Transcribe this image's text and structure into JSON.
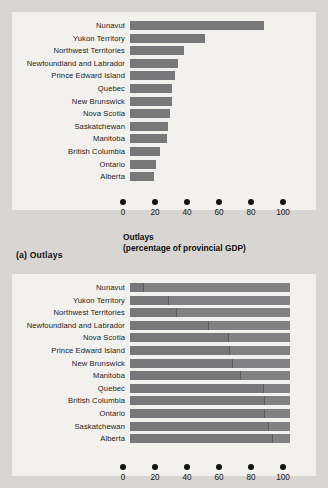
{
  "figure": {
    "panel_a_caption": "(a) Outlays",
    "axis_ticks": [
      "0",
      "20",
      "40",
      "60",
      "80",
      "100"
    ],
    "axis_title_line1": "Outlays",
    "axis_title_line2": "(percentage of provincial GDP)",
    "bar_color": "#78787a",
    "segment_color": "#818183",
    "panel_bg": "#f2f1ee",
    "page_bg": "#d8d6d2"
  },
  "chart_data": [
    {
      "type": "bar",
      "orientation": "horizontal",
      "title": "(a) Outlays",
      "xlabel": "Outlays (percentage of provincial GDP)",
      "ylabel": "",
      "xlim": [
        0,
        100
      ],
      "xticks": [
        0,
        20,
        40,
        60,
        80,
        100
      ],
      "grid": false,
      "legend": "none",
      "categories": [
        "Nunavut",
        "Yukon Territory",
        "Northwest Territories",
        "Newfoundland and Labrador",
        "Prince Edward Island",
        "Quebec",
        "New Brunswick",
        "Nova Scotia",
        "Saskatchewan",
        "Manitoba",
        "British Columbia",
        "Ontario",
        "Alberta"
      ],
      "values": [
        84,
        47,
        34,
        30,
        28,
        26,
        26,
        25,
        24,
        23,
        19,
        16,
        15
      ]
    },
    {
      "type": "bar",
      "orientation": "horizontal",
      "subtype": "stacked",
      "title": "",
      "xlabel": "",
      "ylabel": "",
      "xlim": [
        0,
        100
      ],
      "xticks": [
        0,
        20,
        40,
        60,
        80,
        100
      ],
      "grid": false,
      "legend": "none",
      "categories": [
        "Nunavut",
        "Yukon Territory",
        "Northwest Territories",
        "Newfoundland and Labrador",
        "Nova Scotia",
        "Prince Edward Island",
        "New Brunswick",
        "Manitoba",
        "Quebec",
        "British Columbia",
        "Ontario",
        "Saskatchewan",
        "Alberta"
      ],
      "series": [
        {
          "name": "Segment 1",
          "values": [
            8,
            24,
            29,
            49,
            61,
            62,
            64,
            69,
            83,
            84,
            84,
            86,
            89
          ]
        },
        {
          "name": "Segment 2",
          "values": [
            92,
            76,
            71,
            51,
            39,
            38,
            36,
            31,
            17,
            16,
            16,
            14,
            11
          ]
        }
      ],
      "totals": [
        100,
        100,
        100,
        100,
        100,
        100,
        100,
        100,
        100,
        100,
        100,
        100,
        100
      ]
    }
  ]
}
